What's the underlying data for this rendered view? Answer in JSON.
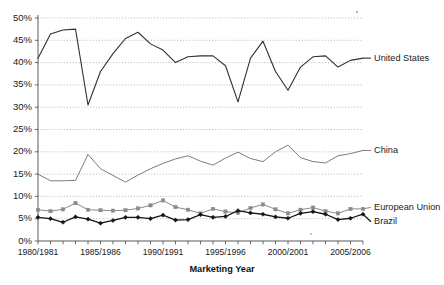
{
  "chart_data": {
    "type": "line",
    "title": "",
    "xlabel": "Marketing Year",
    "ylabel": "",
    "ylim": [
      0,
      50
    ],
    "ytick_labels": [
      "0%",
      "5%",
      "10%",
      "15%",
      "20%",
      "25%",
      "30%",
      "35%",
      "40%",
      "45%",
      "50%"
    ],
    "ytick_values": [
      0,
      5,
      10,
      15,
      20,
      25,
      30,
      35,
      40,
      45,
      50
    ],
    "grid": true,
    "legend_position": "right-inline",
    "x": [
      "1980/1981",
      "1981/1982",
      "1982/1983",
      "1983/1984",
      "1984/1985",
      "1985/1986",
      "1986/1987",
      "1987/1988",
      "1988/1989",
      "1989/1990",
      "1990/1991",
      "1991/1992",
      "1992/1993",
      "1993/1994",
      "1994/1995",
      "1995/1996",
      "1996/1997",
      "1997/1998",
      "1998/1999",
      "1999/2000",
      "2000/2001",
      "2001/2002",
      "2002/2003",
      "2003/2004",
      "2004/2005",
      "2005/2006",
      "2006/2007"
    ],
    "xtick_labels": [
      "1980/1981",
      "1985/1986",
      "1990/1991",
      "1995/1996",
      "2000/2001",
      "2005/2006"
    ],
    "xtick_indices": [
      0,
      5,
      10,
      15,
      20,
      25
    ],
    "series": [
      {
        "name": "United States",
        "color": "#303030",
        "marker": "none",
        "width": 1.1,
        "values": [
          41.0,
          46.4,
          47.3,
          47.5,
          30.5,
          38.0,
          42.0,
          45.4,
          46.8,
          44.2,
          42.8,
          40.0,
          41.3,
          41.5,
          41.5,
          39.3,
          31.2,
          41.0,
          44.8,
          38.0,
          33.8,
          39.0,
          41.3,
          41.5,
          39.0,
          40.5,
          41.0
        ]
      },
      {
        "name": "China",
        "color": "#6e6e6e",
        "marker": "none",
        "width": 0.9,
        "values": [
          15.0,
          13.5,
          13.5,
          13.6,
          19.4,
          16.2,
          14.7,
          13.2,
          14.8,
          16.2,
          17.4,
          18.4,
          19.1,
          17.9,
          17.0,
          18.6,
          19.9,
          18.5,
          17.8,
          20.0,
          21.5,
          18.7,
          17.8,
          17.5,
          19.1,
          19.6,
          20.3
        ]
      },
      {
        "name": "European Union",
        "color": "#8a8a8a",
        "marker": "square",
        "width": 1.0,
        "values": [
          7.0,
          6.7,
          7.1,
          8.5,
          7.0,
          6.9,
          6.8,
          6.9,
          7.3,
          8.0,
          9.1,
          7.6,
          7.0,
          6.2,
          7.2,
          6.6,
          6.3,
          7.4,
          8.2,
          7.1,
          6.2,
          7.0,
          7.5,
          6.7,
          6.2,
          7.2,
          7.2
        ]
      },
      {
        "name": "Brazil",
        "color": "#151515",
        "marker": "diamond",
        "width": 1.3,
        "values": [
          5.3,
          5.0,
          4.2,
          5.4,
          4.9,
          4.0,
          4.6,
          5.3,
          5.3,
          5.0,
          5.8,
          4.7,
          4.8,
          5.9,
          5.3,
          5.5,
          6.8,
          6.3,
          6.0,
          5.4,
          5.1,
          6.2,
          6.6,
          6.0,
          4.8,
          5.1,
          6.0
        ]
      }
    ]
  },
  "axis": {
    "x_title": "Marketing Year"
  },
  "labels": {
    "united_states": "United States",
    "china": "China",
    "european_union": "European Union",
    "brazil": "Brazil"
  }
}
